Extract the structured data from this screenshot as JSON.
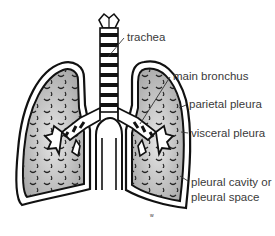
{
  "diagram": {
    "colors": {
      "outline": "#111111",
      "lung_fill": "#b8b8b8",
      "lung_fill_light": "#e4e4e4",
      "label_text": "#3a3a3a",
      "background": "#ffffff"
    },
    "labels": [
      {
        "id": "trachea",
        "text": "trachea"
      },
      {
        "id": "main-bronchus",
        "text": "main bronchus"
      },
      {
        "id": "parietal-pleura",
        "text": "parietal pleura"
      },
      {
        "id": "visceral-pleura",
        "text": "visceral pleura"
      },
      {
        "id": "pleural-cavity",
        "text": "pleural cavity or",
        "text2": "pleural space"
      }
    ]
  }
}
